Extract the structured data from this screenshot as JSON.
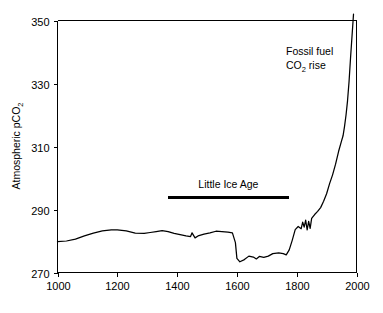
{
  "chart_data": {
    "type": "line",
    "title": "",
    "xlabel": "",
    "ylabel": "Atmospheric pCO2",
    "ylabel_parts": {
      "main": "Atmospheric pCO",
      "subscript": "2"
    },
    "xlim": [
      1000,
      2000
    ],
    "ylim": [
      270,
      350
    ],
    "xticks": [
      1000,
      1200,
      1400,
      1600,
      1800,
      2000
    ],
    "xtick_labels": [
      "1000",
      "1200",
      "1400",
      "1600",
      "1800",
      "2000"
    ],
    "yticks": [
      270,
      290,
      310,
      330,
      350
    ],
    "ytick_labels": [
      "270",
      "290",
      "310",
      "330",
      "350"
    ],
    "grid": false,
    "legend": "none",
    "series": [
      {
        "name": "Atmospheric pCO2",
        "color": "#000000",
        "x": [
          1000,
          1030,
          1060,
          1090,
          1120,
          1150,
          1180,
          1200,
          1230,
          1260,
          1290,
          1310,
          1330,
          1350,
          1370,
          1390,
          1410,
          1430,
          1445,
          1450,
          1460,
          1470,
          1490,
          1510,
          1530,
          1550,
          1570,
          1585,
          1595,
          1600,
          1610,
          1625,
          1640,
          1655,
          1665,
          1675,
          1690,
          1705,
          1720,
          1740,
          1755,
          1765,
          1775,
          1785,
          1795,
          1805,
          1815,
          1820,
          1825,
          1830,
          1835,
          1840,
          1845,
          1850,
          1860,
          1870,
          1880,
          1890,
          1900,
          1910,
          1920,
          1930,
          1940,
          1950,
          1955,
          1960,
          1965,
          1970,
          1975,
          1980,
          1985,
          1990
        ],
        "y": [
          279.8,
          280.0,
          280.6,
          281.6,
          282.5,
          283.2,
          283.5,
          283.5,
          283.2,
          282.5,
          282.4,
          282.7,
          283.0,
          283.3,
          283.0,
          282.4,
          282.0,
          281.6,
          281.4,
          282.6,
          281.0,
          281.6,
          282.2,
          282.6,
          283.1,
          283.0,
          282.8,
          282.6,
          279.5,
          274.5,
          273.4,
          274.1,
          275.2,
          274.9,
          274.3,
          275.1,
          274.8,
          275.2,
          276.0,
          276.2,
          276.0,
          275.6,
          277.2,
          280.2,
          283.6,
          284.6,
          283.9,
          286.0,
          284.4,
          286.6,
          283.5,
          286.2,
          284.0,
          287.2,
          288.4,
          289.4,
          290.6,
          292.6,
          295.0,
          298.2,
          301.0,
          304.4,
          308.4,
          311.8,
          313.4,
          316.4,
          320.0,
          324.5,
          330.5,
          338.0,
          345.0,
          352.0
        ]
      }
    ],
    "annotations": [
      {
        "id": "fossil-fuel-note",
        "line1": "Fossil fuel",
        "line2_main": "CO",
        "line2_sub": "2",
        "line2_tail": " rise",
        "text": "Fossil fuel CO2 rise",
        "x_px": 286,
        "y_px": 55
      }
    ],
    "era_markers": [
      {
        "id": "little-ice-age",
        "label": "Little Ice Age",
        "x_start": 1368,
        "x_end": 1775,
        "y_value": 294.0,
        "label_y_value": 296.8
      }
    ]
  }
}
